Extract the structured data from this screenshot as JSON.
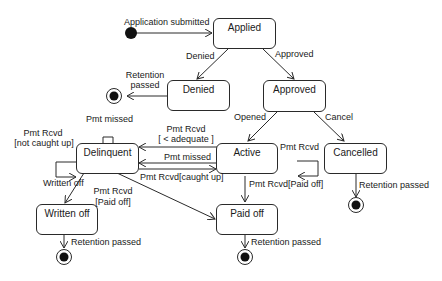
{
  "diagram": {
    "type": "uml-state-machine",
    "initial_transition": "Application submitted",
    "states": {
      "applied": "Applied",
      "denied": "Denied",
      "approved": "Approved",
      "delinquent": "Delinquent",
      "active": "Active",
      "cancelled": "Cancelled",
      "written_off": "Written off",
      "paid_off": "Paid off"
    },
    "transitions": {
      "applied_denied": "Denied",
      "applied_approved": "Approved",
      "denied_final_1": "Retention",
      "denied_final_2": "passed",
      "approved_active": "Opened",
      "approved_cancelled": "Cancel",
      "active_self": "Pmt Rcvd",
      "delinquent_self_missed": "Pmt missed",
      "delinquent_self_rcvd_1": "Pmt Rcvd",
      "delinquent_self_rcvd_2": "[not caught up]",
      "active_delinquent_partial_1": "Pmt Rcvd",
      "active_delinquent_partial_2": "[ < adequate ]",
      "active_delinquent_missed": "Pmt missed",
      "delinquent_active_caughtup": "Pmt Rcvd[caught up]",
      "delinquent_writtenoff": "Written off",
      "delinquent_paidoff_1": "Pmt Rcvd",
      "delinquent_paidoff_2": "[Paid off]",
      "active_paidoff": "Pmt Rcvd[Paid off]",
      "cancelled_final": "Retention passed",
      "writtenoff_final": "Retention passed",
      "paidoff_final": "Retention passed"
    }
  }
}
